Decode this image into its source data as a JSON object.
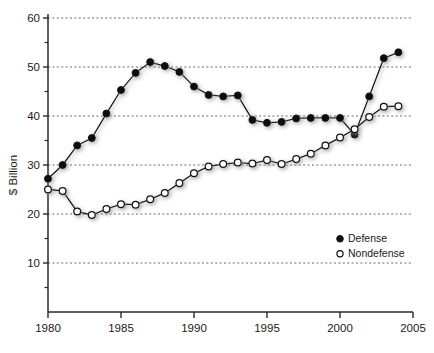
{
  "chart_data": {
    "type": "line",
    "title": "",
    "xlabel": "",
    "ylabel": "$ Billion",
    "xlim": [
      1980,
      2005
    ],
    "ylim": [
      0,
      60
    ],
    "grid": true,
    "grid_values": [
      10,
      20,
      30,
      40,
      50,
      60
    ],
    "legend_position": "bottom-right",
    "x_ticks": [
      "1980",
      "1985",
      "1990",
      "1995",
      "2000",
      "2005"
    ],
    "x_tick_values": [
      1980,
      1985,
      1990,
      1995,
      2000,
      2005
    ],
    "y_ticks": [
      "10",
      "20",
      "30",
      "40",
      "50",
      "60"
    ],
    "y_tick_values": [
      10,
      20,
      30,
      40,
      50,
      60
    ],
    "y_minor_tick_values": [
      5,
      15,
      25,
      35,
      45,
      55
    ],
    "x": [
      1980,
      1981,
      1982,
      1983,
      1984,
      1985,
      1986,
      1987,
      1988,
      1989,
      1990,
      1991,
      1992,
      1993,
      1994,
      1995,
      1996,
      1997,
      1998,
      1999,
      2000,
      2001,
      2002,
      2003,
      2004
    ],
    "series": [
      {
        "name": "Defense",
        "marker": "filled-circle",
        "color": "#111111",
        "values": [
          27.2,
          30.0,
          34.0,
          35.5,
          40.5,
          45.3,
          48.8,
          51.0,
          50.2,
          49.0,
          46.0,
          44.3,
          44.0,
          44.2,
          39.2,
          38.6,
          38.8,
          39.5,
          39.6,
          39.6,
          39.6,
          36.2,
          44.0,
          51.8,
          53.0
        ]
      },
      {
        "name": "Nondefense",
        "marker": "open-circle",
        "color": "#111111",
        "values": [
          25.0,
          24.7,
          20.5,
          19.8,
          21.0,
          22.0,
          21.9,
          23.0,
          24.3,
          26.3,
          28.3,
          29.7,
          30.2,
          30.5,
          30.3,
          31.0,
          30.2,
          31.2,
          32.3,
          34.0,
          35.6,
          37.3,
          39.8,
          41.9,
          42.0
        ]
      }
    ],
    "legend": [
      {
        "label": "Defense",
        "marker": "filled-circle"
      },
      {
        "label": "Nondefense",
        "marker": "open-circle"
      }
    ]
  },
  "colors": {
    "line": "#111111",
    "marker_fill_defense": "#111111",
    "marker_fill_nondefense": "#ffffff",
    "grid": "#5a5a5a",
    "axis": "#2a2a2a",
    "background": "#ffffff"
  }
}
